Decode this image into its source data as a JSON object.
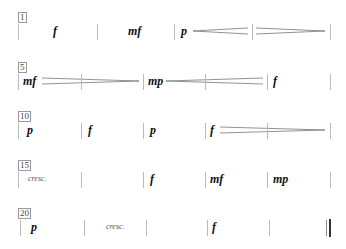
{
  "systems": [
    {
      "measure_number": "1",
      "dynamics": [
        {
          "measure": 1,
          "mark": "f"
        },
        {
          "measure": 2,
          "mark": "mf"
        },
        {
          "measure": 3,
          "mark": "p"
        }
      ],
      "hairpins": [
        {
          "type": "crescendo",
          "from_measure": 3,
          "to_measure": 3
        },
        {
          "type": "decrescendo",
          "from_measure": 4,
          "to_measure": 4
        }
      ]
    },
    {
      "measure_number": "5",
      "dynamics": [
        {
          "measure": 5,
          "mark": "mf"
        },
        {
          "measure": 7,
          "mark": "mp"
        },
        {
          "measure": 9,
          "mark": "f"
        }
      ],
      "hairpins": [
        {
          "type": "decrescendo",
          "from_measure": 5,
          "to_measure": 6
        },
        {
          "type": "crescendo",
          "from_measure": 7,
          "to_measure": 8
        }
      ]
    },
    {
      "measure_number": "10",
      "dynamics": [
        {
          "measure": 10,
          "mark": "p"
        },
        {
          "measure": 11,
          "mark": "f"
        },
        {
          "measure": 12,
          "mark": "p"
        },
        {
          "measure": 13,
          "mark": "f"
        }
      ],
      "hairpins": [
        {
          "type": "decrescendo",
          "from_measure": 13,
          "to_measure": 14
        }
      ]
    },
    {
      "measure_number": "15",
      "texts": [
        {
          "measure": 15,
          "text": "cresc."
        }
      ],
      "dynamics": [
        {
          "measure": 17,
          "mark": "f"
        },
        {
          "measure": 18,
          "mark": "mf"
        },
        {
          "measure": 19,
          "mark": "mp"
        }
      ]
    },
    {
      "measure_number": "20",
      "texts": [
        {
          "measure": 21,
          "text": "cresc."
        }
      ],
      "dynamics": [
        {
          "measure": 20,
          "mark": "p"
        },
        {
          "measure": 23,
          "mark": "f"
        }
      ],
      "final_barline": true
    }
  ]
}
